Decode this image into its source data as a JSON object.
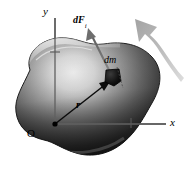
{
  "figure": {
    "background_color": "#ffffff",
    "width": 184,
    "height": 169
  },
  "axes": {
    "origin_label": "O",
    "y_axis_label": "y",
    "x_axis_label": "x",
    "axis_color": "#4a4a4a",
    "origin_point": {
      "x": 55,
      "y": 124
    },
    "y_axis_top": {
      "x": 55,
      "y": 18
    },
    "x_axis_right": {
      "x": 166,
      "y": 124
    },
    "y_tick": {
      "x": 55,
      "y": 52
    },
    "x_tick": {
      "x": 131,
      "y": 124
    }
  },
  "body": {
    "name": "rigid-body",
    "fill_dark": "#1a1a1a",
    "fill_mid": "#5a5a5a",
    "fill_light": "#d8d8d8",
    "outline_color": "#2b2b2b",
    "highlight_color": "#e8e8e8"
  },
  "mass_element": {
    "label": "dm",
    "color": "#000000",
    "position": {
      "x": 112,
      "y": 78
    },
    "leader_line_color": "#555555"
  },
  "position_vector": {
    "label": "r",
    "color": "#000000",
    "from": {
      "x": 55,
      "y": 124
    },
    "to": {
      "x": 108,
      "y": 82
    }
  },
  "force_vector": {
    "label_base": "dF",
    "label_subscript": "i",
    "color": "#6b6b6b",
    "from": {
      "x": 110,
      "y": 74
    },
    "to": {
      "x": 88,
      "y": 30
    }
  },
  "motion_arrow": {
    "name": "motion-arrow",
    "color_light": "#cdcdcd",
    "color_dark": "#9a9a9a",
    "description": "large curved gray arrow pointing up-left"
  }
}
